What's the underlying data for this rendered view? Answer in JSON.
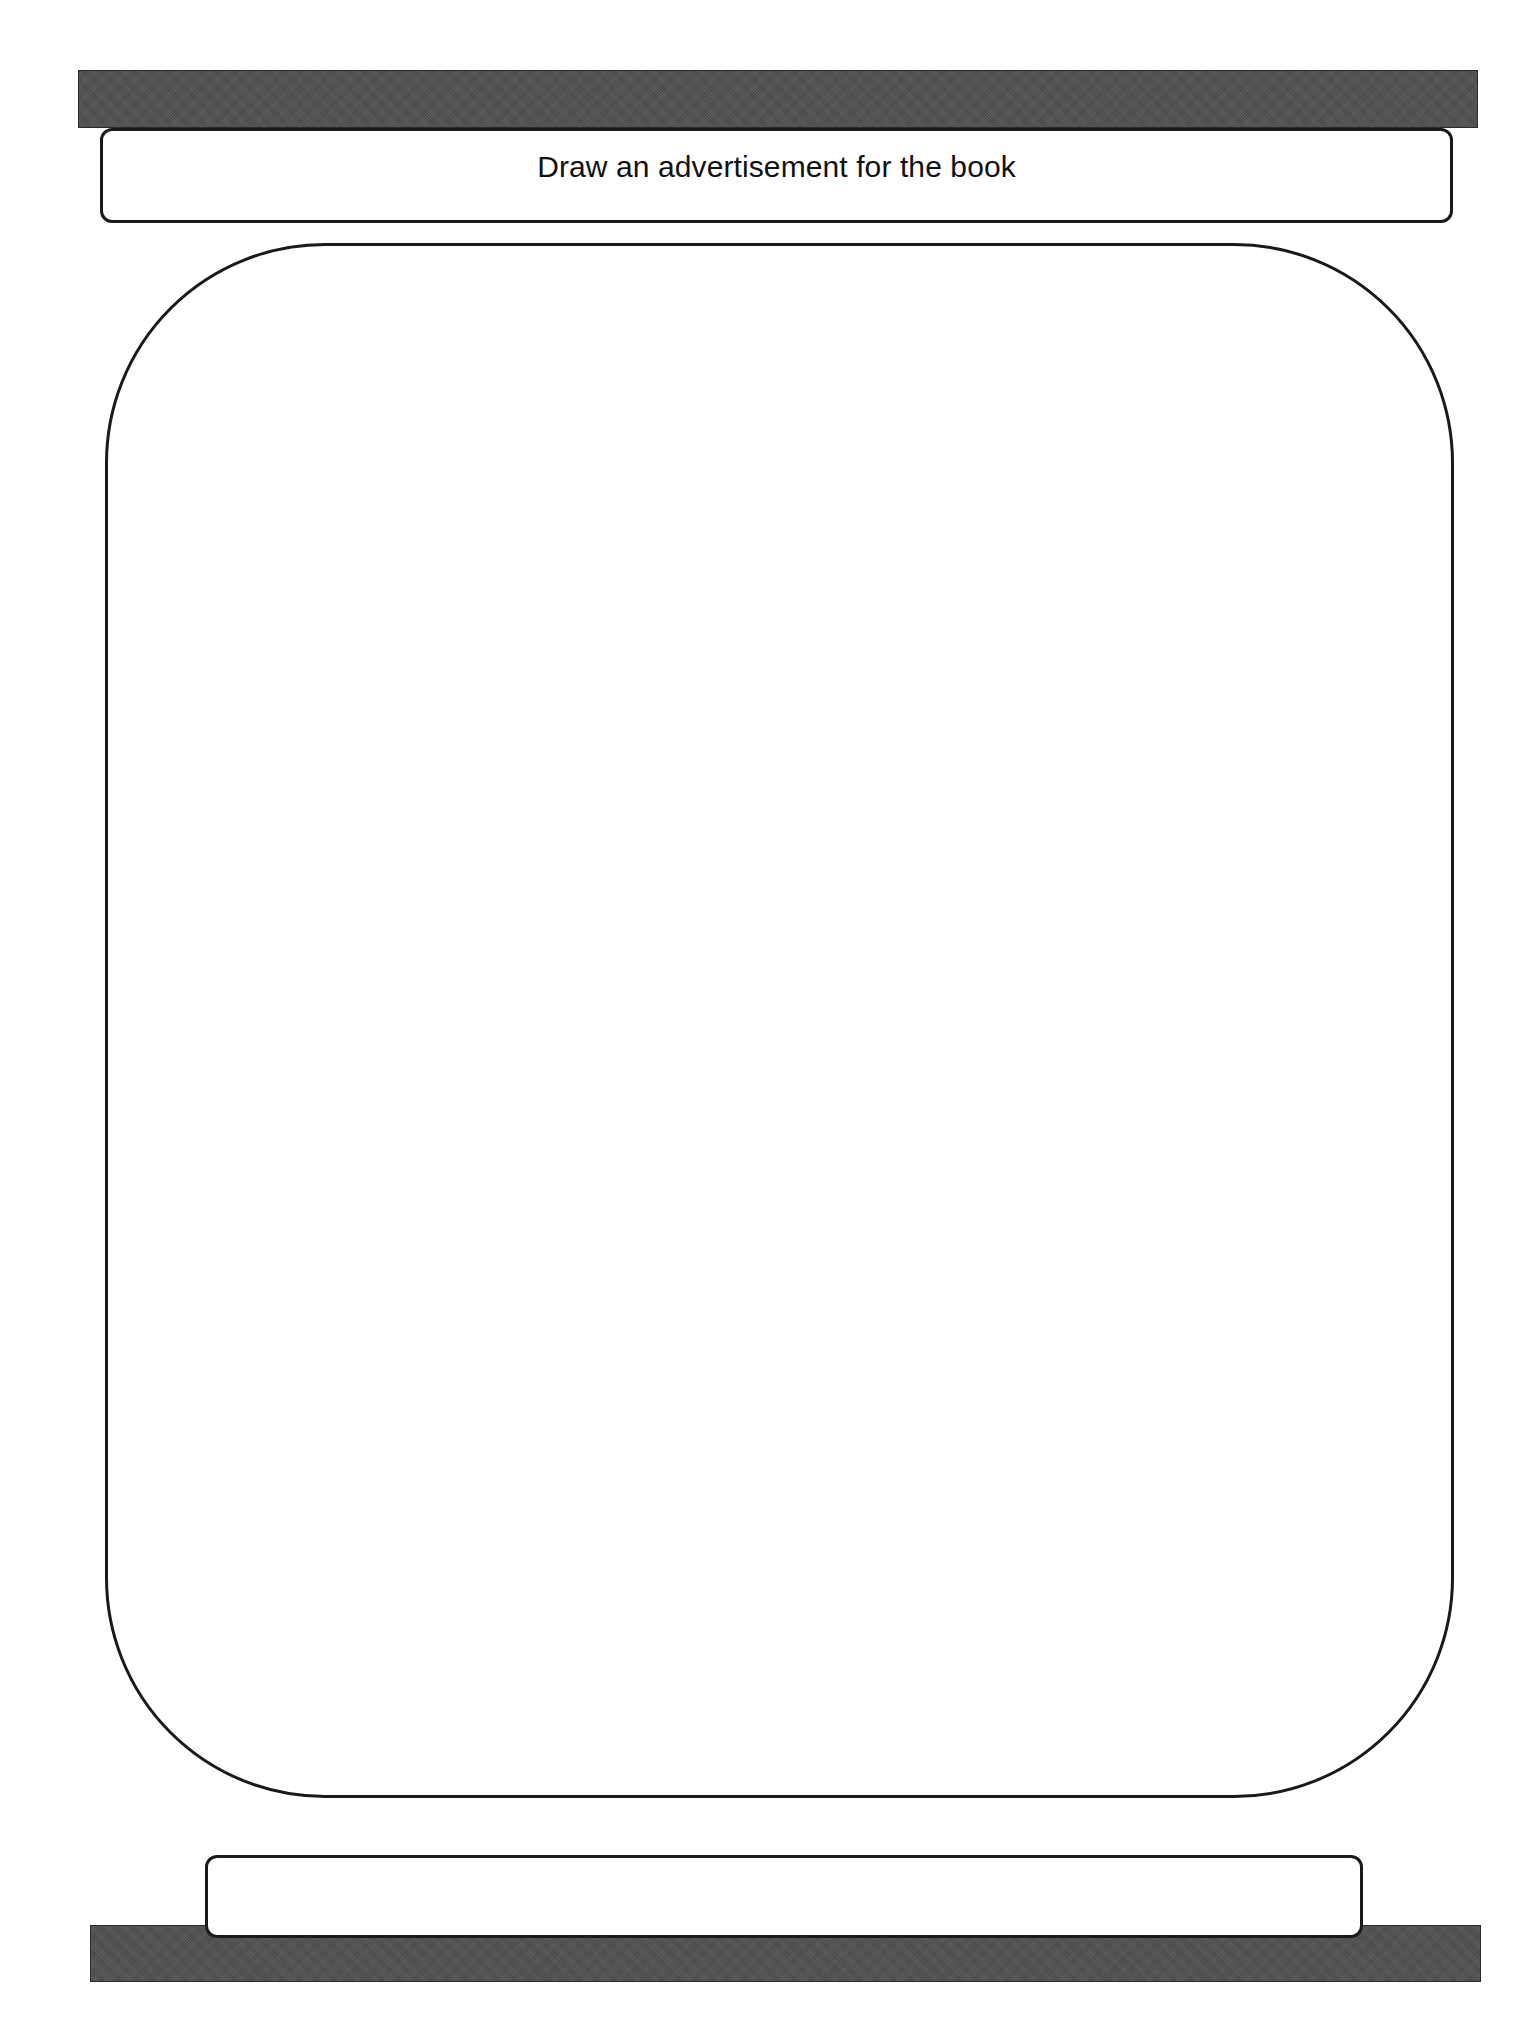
{
  "page": {
    "title_box": {
      "text": "Draw an advertisement for the book"
    },
    "drawing_area": {
      "content": ""
    },
    "caption_box": {
      "text": ""
    }
  },
  "colors": {
    "bar": "#4f4f4f",
    "outline": "#1a1a1a",
    "background": "#ffffff"
  }
}
